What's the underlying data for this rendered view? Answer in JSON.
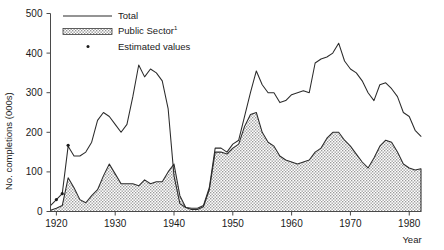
{
  "chart_data": {
    "type": "area",
    "title": "",
    "xlabel": "Year",
    "ylabel": "No. completions (000s)",
    "xlim": [
      1919,
      1982
    ],
    "ylim": [
      0,
      500
    ],
    "grid": false,
    "legend_position": "top-left",
    "yticks": [
      0,
      100,
      200,
      300,
      400,
      500
    ],
    "ytick_labels": [
      "0",
      "100",
      "200",
      "300",
      "400",
      "500"
    ],
    "xticks": [
      1920,
      1930,
      1940,
      1950,
      1960,
      1970,
      1980
    ],
    "xtick_labels": [
      "1920",
      "1930",
      "1940",
      "1950",
      "1960",
      "1970",
      "1980"
    ],
    "x": [
      1919,
      1920,
      1921,
      1922,
      1923,
      1924,
      1925,
      1926,
      1927,
      1928,
      1929,
      1930,
      1931,
      1932,
      1933,
      1934,
      1935,
      1936,
      1937,
      1938,
      1939,
      1940,
      1941,
      1942,
      1943,
      1944,
      1945,
      1946,
      1947,
      1948,
      1949,
      1950,
      1951,
      1952,
      1953,
      1954,
      1955,
      1956,
      1957,
      1958,
      1959,
      1960,
      1961,
      1962,
      1963,
      1964,
      1965,
      1966,
      1967,
      1968,
      1969,
      1970,
      1971,
      1972,
      1973,
      1974,
      1975,
      1976,
      1977,
      1978,
      1979,
      1980,
      1981,
      1982
    ],
    "series": [
      {
        "name": "Total",
        "style": "line",
        "values": [
          15,
          30,
          45,
          165,
          140,
          140,
          150,
          175,
          230,
          250,
          240,
          220,
          200,
          220,
          290,
          370,
          340,
          360,
          350,
          330,
          260,
          90,
          20,
          10,
          8,
          8,
          15,
          60,
          160,
          160,
          150,
          170,
          180,
          240,
          300,
          355,
          320,
          300,
          300,
          275,
          280,
          295,
          300,
          305,
          300,
          375,
          385,
          390,
          400,
          425,
          380,
          360,
          350,
          330,
          300,
          280,
          320,
          325,
          310,
          290,
          250,
          240,
          205,
          190
        ]
      },
      {
        "name": "Public Sector",
        "style": "filled-hatched",
        "values": [
          3,
          8,
          15,
          85,
          60,
          30,
          22,
          40,
          55,
          90,
          120,
          95,
          70,
          70,
          70,
          65,
          80,
          70,
          75,
          75,
          100,
          120,
          40,
          10,
          5,
          5,
          12,
          55,
          150,
          150,
          145,
          160,
          170,
          215,
          245,
          250,
          200,
          175,
          165,
          140,
          130,
          125,
          120,
          125,
          130,
          150,
          160,
          185,
          200,
          200,
          180,
          165,
          145,
          125,
          110,
          135,
          165,
          180,
          175,
          150,
          120,
          110,
          105,
          108
        ]
      }
    ],
    "annotations": {
      "estimated_points": [
        {
          "x": 1920,
          "y": 30
        },
        {
          "x": 1921,
          "y": 45
        },
        {
          "x": 1922,
          "y": 167
        }
      ]
    },
    "legend": [
      {
        "label": "Total",
        "swatch": "line"
      },
      {
        "label": "Public Sector",
        "superscript": "1",
        "swatch": "hatch"
      },
      {
        "label": "Estimated values",
        "swatch": "dot"
      }
    ]
  },
  "colors": {
    "line": "#2b2b2b",
    "axis": "#4a4a4a",
    "hatch_fill": "#d9d9d9",
    "background": "#ffffff",
    "text": "#1a1a1a"
  }
}
